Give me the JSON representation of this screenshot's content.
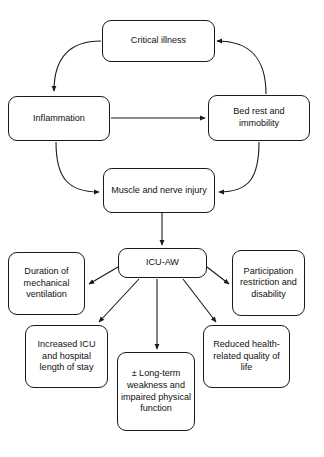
{
  "diagram": {
    "stroke_color": "#1a1a1a",
    "background_color": "#ffffff",
    "nodes": {
      "critical_illness": "Critical illness",
      "inflammation": "Inflammation",
      "bed_rest": "Bed rest and immobility",
      "muscle_injury": "Muscle and nerve injury",
      "icu_aw": "ICU-AW",
      "duration_ventilation": "Duration of mechanical ventilation",
      "participation": "Participation restriction and disability",
      "increased_los": "Increased ICU and hospital length of stay",
      "long_term": "± Long-term weakness and impaired physical function",
      "reduced_hrqol": "Reduced health-related quality of life"
    },
    "edges": [
      {
        "from": "critical_illness",
        "to": "inflammation",
        "style": "curved",
        "arrow": "down"
      },
      {
        "from": "inflammation",
        "to": "bed_rest",
        "style": "straight",
        "arrow": "right"
      },
      {
        "from": "bed_rest",
        "to": "critical_illness",
        "style": "curved",
        "arrow": "left"
      },
      {
        "from": "inflammation",
        "to": "muscle_injury",
        "style": "curved",
        "arrow": "right"
      },
      {
        "from": "bed_rest",
        "to": "muscle_injury",
        "style": "curved",
        "arrow": "left"
      },
      {
        "from": "muscle_injury",
        "to": "icu_aw",
        "style": "straight",
        "arrow": "down"
      },
      {
        "from": "icu_aw",
        "to": "duration_ventilation",
        "style": "straight",
        "arrow": "down-left"
      },
      {
        "from": "icu_aw",
        "to": "participation",
        "style": "straight",
        "arrow": "down-right"
      },
      {
        "from": "icu_aw",
        "to": "increased_los",
        "style": "straight",
        "arrow": "down-left"
      },
      {
        "from": "icu_aw",
        "to": "long_term",
        "style": "straight",
        "arrow": "down"
      },
      {
        "from": "icu_aw",
        "to": "reduced_hrqol",
        "style": "straight",
        "arrow": "down-right"
      }
    ]
  }
}
